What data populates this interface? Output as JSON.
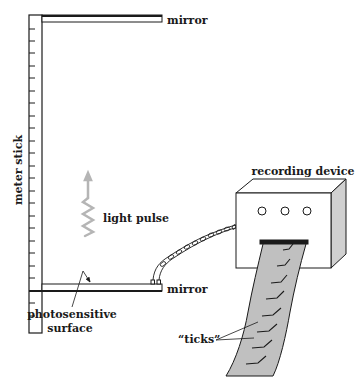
{
  "diagram": {
    "labels": {
      "top_mirror": "mirror",
      "bottom_mirror": "mirror",
      "meter_stick": "meter stick",
      "light_pulse": "light pulse",
      "photosensitive_line1": "photosensitive",
      "photosensitive_line2": "surface",
      "recording_device": "recording device",
      "ticks": "“ticks”"
    },
    "components": [
      {
        "name": "meter-stick",
        "tick_count": 25
      },
      {
        "name": "top-mirror"
      },
      {
        "name": "bottom-mirror"
      },
      {
        "name": "light-pulse-arrow",
        "direction": "up"
      },
      {
        "name": "twisted-cable"
      },
      {
        "name": "recording-device",
        "knobs": 3
      },
      {
        "name": "paper-tape",
        "ticks": 8
      }
    ],
    "colors": {
      "line": "#1a1a1a",
      "light_pulse": "#b5b5b5",
      "tape": "#c0c0c0",
      "device_side": "#d0d0d0"
    }
  }
}
